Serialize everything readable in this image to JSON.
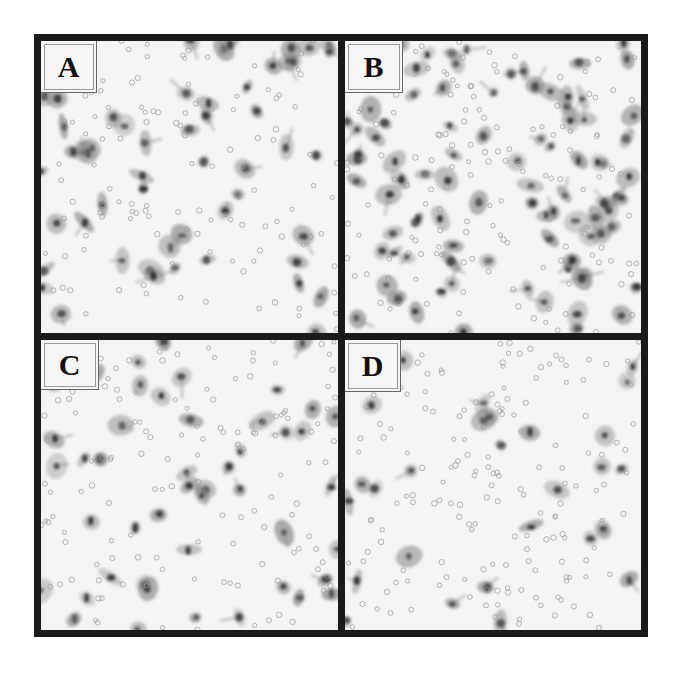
{
  "figure": {
    "panels": [
      {
        "id": "A",
        "label": "A",
        "density": "moderate"
      },
      {
        "id": "B",
        "label": "B",
        "density": "high"
      },
      {
        "id": "C",
        "label": "C",
        "density": "moderate"
      },
      {
        "id": "D",
        "label": "D",
        "density": "low"
      }
    ],
    "colors": {
      "border": "#1a1a1a",
      "background": "#f4f4f4",
      "cell_body": "#8a8a8a",
      "nucleus": "#2e2e2e",
      "pore": "#9a9a9a"
    }
  }
}
